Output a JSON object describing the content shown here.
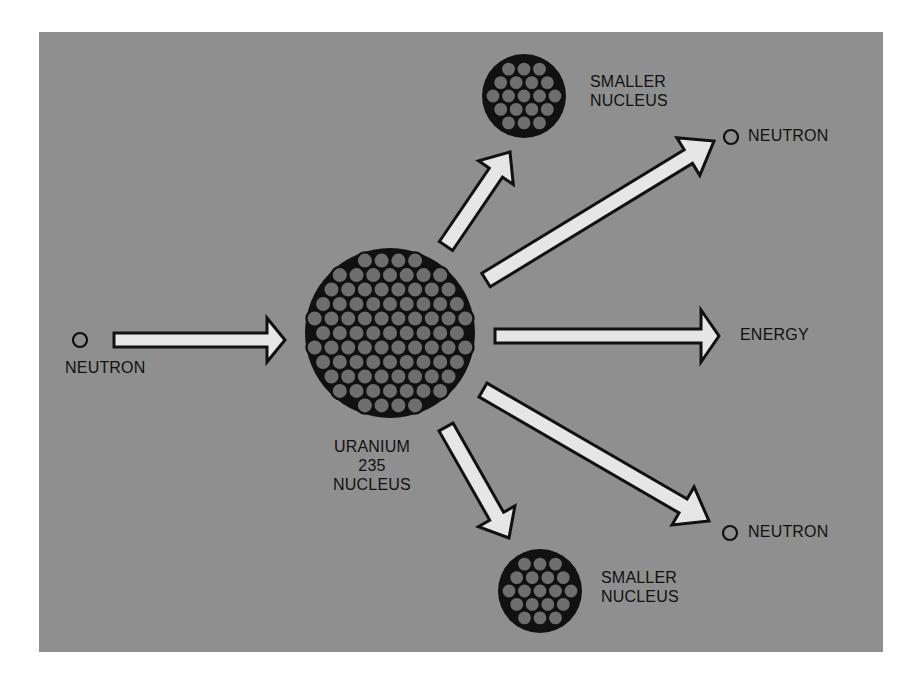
{
  "diagram": {
    "colors": {
      "page_bg": "#ffffff",
      "panel_bg": "#8f8f8f",
      "arrow_fill": "#e6e6e6",
      "outline": "#111111",
      "nucleon_fill": "#6e6e6e",
      "text": "#111111"
    },
    "panel": {
      "x": 39,
      "y": 32,
      "width": 844,
      "height": 620
    },
    "nodes": {
      "incoming_neutron": {
        "label": "NEUTRON",
        "cx": 80,
        "cy": 340,
        "r": 7
      },
      "uranium_nucleus": {
        "label_lines": [
          "URANIUM",
          "235",
          "NUCLEUS"
        ],
        "cx": 390,
        "cy": 333,
        "r": 85,
        "nucleon_r": 8.2
      },
      "smaller_nucleus_top": {
        "label_lines": [
          "SMALLER",
          "NUCLEUS"
        ],
        "cx": 524,
        "cy": 96,
        "r": 42,
        "nucleon_r": 7.6
      },
      "smaller_nucleus_bottom": {
        "label_lines": [
          "SMALLER",
          "NUCLEUS"
        ],
        "cx": 540,
        "cy": 591,
        "r": 42,
        "nucleon_r": 7.6
      },
      "neutron_top_right": {
        "label": "NEUTRON",
        "cx": 731,
        "cy": 137,
        "r": 7
      },
      "neutron_bottom_right": {
        "label": "NEUTRON",
        "cx": 730,
        "cy": 533,
        "r": 7
      },
      "energy": {
        "label": "ENERGY"
      }
    },
    "arrows": [
      {
        "id": "incoming",
        "from": [
          114,
          340
        ],
        "to": [
          285,
          340
        ],
        "width": 14,
        "head_len": 18,
        "head_half": 22
      },
      {
        "id": "to-smaller-top",
        "from": [
          446,
          246
        ],
        "to": [
          510,
          152
        ],
        "width": 16,
        "head_len": 25,
        "head_half": 21
      },
      {
        "id": "to-neutron-top",
        "from": [
          486,
          280
        ],
        "to": [
          714,
          141
        ],
        "width": 16,
        "head_len": 30,
        "head_half": 22
      },
      {
        "id": "to-energy",
        "from": [
          495,
          336
        ],
        "to": [
          719,
          336
        ],
        "width": 14,
        "head_len": 18,
        "head_half": 26
      },
      {
        "id": "to-neutron-bottom",
        "from": [
          483,
          390
        ],
        "to": [
          709,
          521
        ],
        "width": 16,
        "head_len": 30,
        "head_half": 22
      },
      {
        "id": "to-smaller-bottom",
        "from": [
          446,
          427
        ],
        "to": [
          509,
          538
        ],
        "width": 16,
        "head_len": 25,
        "head_half": 21
      }
    ],
    "labels": [
      {
        "id": "label-incoming-neutron",
        "lines": [
          "NEUTRON"
        ],
        "x": 65,
        "y": 358,
        "align": "left",
        "width": 110
      },
      {
        "id": "label-uranium",
        "lines": [
          "URANIUM",
          "235",
          "NUCLEUS"
        ],
        "x": 307,
        "y": 437,
        "align": "center",
        "width": 130
      },
      {
        "id": "label-smaller-top",
        "lines": [
          "SMALLER",
          "NUCLEUS"
        ],
        "x": 590,
        "y": 72,
        "align": "left",
        "width": 110
      },
      {
        "id": "label-smaller-bottom",
        "lines": [
          "SMALLER",
          "NUCLEUS"
        ],
        "x": 601,
        "y": 568,
        "align": "left",
        "width": 110
      },
      {
        "id": "label-neutron-top",
        "lines": [
          "NEUTRON"
        ],
        "x": 748,
        "y": 126,
        "align": "left",
        "width": 110
      },
      {
        "id": "label-neutron-bottom",
        "lines": [
          "NEUTRON"
        ],
        "x": 748,
        "y": 522,
        "align": "left",
        "width": 110
      },
      {
        "id": "label-energy",
        "lines": [
          "ENERGY"
        ],
        "x": 740,
        "y": 325,
        "align": "left",
        "width": 100
      }
    ]
  }
}
